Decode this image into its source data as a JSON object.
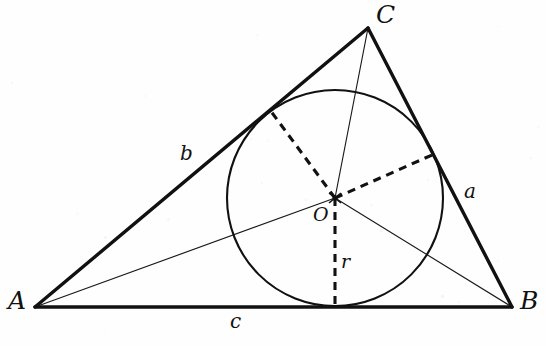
{
  "figure": {
    "kind": "geometry-diagram",
    "width": 546,
    "height": 346,
    "background_color": "#fefefe",
    "ink_color": "#111111"
  },
  "chart_data": {
    "type": "scatter",
    "xlabel": "",
    "ylabel": "",
    "xlim": [
      0,
      546
    ],
    "ylim": [
      0,
      346
    ],
    "grid": false,
    "legend_position": "none",
    "points": [
      {
        "name": "A",
        "x": 35,
        "y": 307,
        "role": "vertex"
      },
      {
        "name": "B",
        "x": 512,
        "y": 307,
        "role": "vertex"
      },
      {
        "name": "C",
        "x": 368,
        "y": 28,
        "role": "vertex"
      },
      {
        "name": "O",
        "x": 335,
        "y": 198,
        "role": "incenter"
      },
      {
        "name": "Ta",
        "x": 432,
        "y": 155,
        "role": "tangent-point-side-a"
      },
      {
        "name": "Tb",
        "x": 270,
        "y": 110,
        "role": "tangent-point-side-b"
      },
      {
        "name": "Tc",
        "x": 335,
        "y": 307,
        "role": "tangent-point-side-c"
      }
    ],
    "circle": {
      "cx": 335,
      "cy": 198,
      "r": 108,
      "name": "incircle"
    },
    "segments": [
      {
        "name": "side-c",
        "from": "A",
        "to": "B",
        "style": "thick"
      },
      {
        "name": "side-b",
        "from": "A",
        "to": "C",
        "style": "thick"
      },
      {
        "name": "side-a",
        "from": "C",
        "to": "B",
        "style": "thick"
      },
      {
        "name": "bisector-from-A",
        "from": "A",
        "to": "O",
        "style": "thin"
      },
      {
        "name": "bisector-from-B",
        "from": "B",
        "to": "O",
        "style": "thin"
      },
      {
        "name": "bisector-from-C",
        "from": "C",
        "to": "O",
        "style": "thin"
      },
      {
        "name": "radius-to-side-a",
        "from": "O",
        "to": "Ta",
        "style": "dashed"
      },
      {
        "name": "radius-to-side-b",
        "from": "O",
        "to": "Tb",
        "style": "dashed"
      },
      {
        "name": "radius-to-side-c",
        "from": "O",
        "to": "Tc",
        "style": "dashed"
      }
    ]
  },
  "labels": {
    "vertex_a": {
      "text": "A",
      "x": 8,
      "y": 288
    },
    "vertex_b": {
      "text": "B",
      "x": 520,
      "y": 288
    },
    "vertex_c": {
      "text": "C",
      "x": 376,
      "y": 2
    },
    "side_a": {
      "text": "a",
      "x": 464,
      "y": 181
    },
    "side_b": {
      "text": "b",
      "x": 180,
      "y": 143
    },
    "side_c": {
      "text": "c",
      "x": 230,
      "y": 311
    },
    "center_o": {
      "text": "O",
      "x": 313,
      "y": 205
    },
    "radius_r": {
      "text": "r",
      "x": 341,
      "y": 252
    }
  }
}
